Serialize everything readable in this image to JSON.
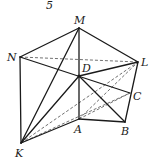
{
  "figure": {
    "number_label": "5",
    "points": {
      "M": {
        "label": "M",
        "x": 79,
        "y": 28,
        "lx": 74,
        "ly": 24
      },
      "N": {
        "label": "N",
        "x": 20,
        "y": 57,
        "lx": 7,
        "ly": 61
      },
      "L": {
        "label": "L",
        "x": 138,
        "y": 62,
        "lx": 141,
        "ly": 66
      },
      "D": {
        "label": "D",
        "x": 79,
        "y": 76,
        "lx": 82,
        "ly": 72
      },
      "C": {
        "label": "C",
        "x": 130,
        "y": 93,
        "lx": 133,
        "ly": 100
      },
      "A": {
        "label": "A",
        "x": 79,
        "y": 119,
        "lx": 74,
        "ly": 133
      },
      "B": {
        "label": "B",
        "x": 125,
        "y": 122,
        "lx": 121,
        "ly": 135
      },
      "K": {
        "label": "K",
        "x": 21,
        "y": 143,
        "lx": 15,
        "ly": 157
      }
    },
    "solid_edges": [
      [
        "M",
        "N"
      ],
      [
        "M",
        "L"
      ],
      [
        "M",
        "D"
      ],
      [
        "M",
        "K"
      ],
      [
        "N",
        "K"
      ],
      [
        "N",
        "C"
      ],
      [
        "D",
        "L"
      ],
      [
        "D",
        "K"
      ],
      [
        "D",
        "B"
      ],
      [
        "D",
        "A"
      ],
      [
        "L",
        "B"
      ],
      [
        "A",
        "B"
      ],
      [
        "A",
        "K"
      ]
    ],
    "dashed_edges": [
      [
        "N",
        "L"
      ],
      [
        "K",
        "L"
      ],
      [
        "K",
        "C"
      ],
      [
        "A",
        "L"
      ],
      [
        "A",
        "C"
      ]
    ]
  }
}
